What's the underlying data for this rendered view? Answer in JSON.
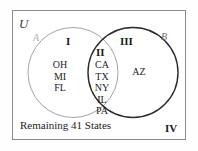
{
  "diagram": {
    "type": "venn",
    "title_label": "U",
    "universe_label": "U",
    "sets": [
      {
        "key": "A",
        "label": "A",
        "stroke": "#9a9a9a",
        "stroke_width": 0.9
      },
      {
        "key": "B",
        "label": "B",
        "stroke": "#2b2b2b",
        "stroke_width": 1.4
      }
    ],
    "regions": [
      {
        "numeral": "I",
        "description": "A only",
        "elements": [
          "OH",
          "MI",
          "FL"
        ]
      },
      {
        "numeral": "II",
        "description": "A intersect B",
        "elements": [
          "CA",
          "TX",
          "NY",
          "IL",
          "PA"
        ]
      },
      {
        "numeral": "III",
        "description": "B only",
        "elements": [
          "AZ"
        ]
      },
      {
        "numeral": "IV",
        "description": "outside both sets",
        "elements": [],
        "note": "Remaining 41 States"
      }
    ],
    "outside_note": "Remaining 41 States",
    "colors": {
      "background": "#ffffff",
      "box_border": "#8a8a8a",
      "circle_a": "#9a9a9a",
      "circle_b": "#2b2b2b",
      "text": "#1d1d1d",
      "label_a": "#b4b4b4",
      "label_b": "#6d6d6d"
    }
  }
}
